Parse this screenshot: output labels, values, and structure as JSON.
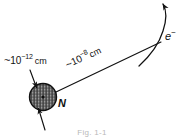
{
  "figure": {
    "caption": "Fig. 1-1",
    "nucleus": {
      "symbol": "N",
      "size_tilde": "~",
      "size_base": "10",
      "size_exponent": "−12",
      "size_unit": "cm"
    },
    "atom": {
      "radius_tilde": "~",
      "radius_base": "10",
      "radius_exponent": "−8",
      "radius_unit": "cm"
    },
    "electron": {
      "symbol": "e",
      "charge": "−"
    },
    "colors": {
      "ink": "#111111",
      "background": "#ffffff",
      "nucleus_fill": "#8f8f8f",
      "nucleus_hatch": "#2a2a2a",
      "caption": "#b9b9b9"
    }
  }
}
